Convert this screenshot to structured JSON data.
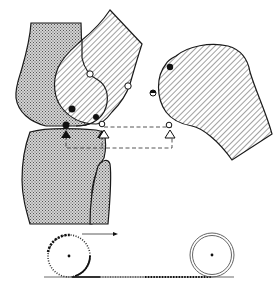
{
  "diagram": {
    "colors": {
      "background": "#ffffff",
      "stroke": "#1a1a1a",
      "stipple_fill": "#9a9a9a",
      "hatch_line": "#555555",
      "dash_line": "#444444"
    },
    "parts": {
      "femur_posterior": {
        "fill": "stipple"
      },
      "femur_flexed": {
        "fill": "hatch"
      },
      "femur_displaced": {
        "fill": "hatch"
      },
      "tibia": {
        "fill": "stipple"
      },
      "fibula": {
        "fill": "stipple"
      }
    },
    "markers": {
      "filled_dots": 4,
      "open_dots": 4,
      "filled_triangles": 2,
      "open_triangles": 2
    },
    "rolling_illustration": {
      "left_wheel": {
        "style": "dotted-circle",
        "arrow_direction": "right"
      },
      "right_wheel": {
        "style": "double-circle"
      },
      "ground_trail": "dotted"
    }
  }
}
